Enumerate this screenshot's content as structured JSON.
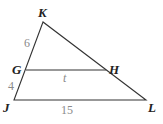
{
  "diagram": {
    "type": "triangle-with-parallel-segment",
    "vertices": {
      "K": {
        "label": "K",
        "x": 43,
        "y": 22
      },
      "G": {
        "label": "G",
        "x": 26,
        "y": 70
      },
      "H": {
        "label": "H",
        "x": 106,
        "y": 70
      },
      "J": {
        "label": "J",
        "x": 14,
        "y": 100
      },
      "L": {
        "label": "L",
        "x": 146,
        "y": 100
      }
    },
    "measures": {
      "KG": "6",
      "GJ": "4",
      "GH": "t",
      "JL": "15"
    },
    "colors": {
      "line": "#333333",
      "vertex_label": "#222222",
      "measure_label": "#8a8a8a"
    }
  }
}
